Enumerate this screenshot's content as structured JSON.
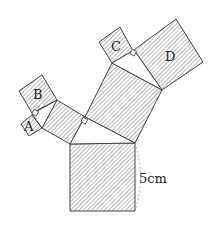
{
  "diagram": {
    "type": "pythagoras-tree",
    "squares": [
      {
        "id": "big-bottom",
        "label": "",
        "points": "70,144 135,143 135,211 70,211"
      },
      {
        "id": "middle-tilted",
        "label": "",
        "points": "85,117 112,63 162,90 135,143"
      },
      {
        "id": "left-medium",
        "label": "",
        "points": "42,128 57,100 85,117 70,144"
      },
      {
        "id": "B",
        "label": "B",
        "points": "19,91 42,75 57,100 32,113"
      },
      {
        "id": "A",
        "label": "A",
        "points": "21,124 32,115 42,128 29,136"
      },
      {
        "id": "C",
        "label": "C",
        "points": "99,42 120,27 133,51 112,63"
      },
      {
        "id": "D",
        "label": "D",
        "points": "134,50 176,19 203,62 162,90"
      }
    ],
    "triangles": [
      {
        "id": "tri-main",
        "points": "70,144 85,117 135,143"
      },
      {
        "id": "tri-left",
        "points": "42,128 32,114 57,100"
      },
      {
        "id": "tri-top",
        "points": "112,63 134,50 162,90"
      }
    ],
    "labels": [
      {
        "text": "A",
        "x": 24,
        "y": 131
      },
      {
        "text": "B",
        "x": 33,
        "y": 99
      },
      {
        "text": "C",
        "x": 111,
        "y": 51
      },
      {
        "text": "D",
        "x": 165,
        "y": 61
      }
    ],
    "dimension": {
      "text": "5cm",
      "x": 139,
      "y": 183
    },
    "hatch_color": "#555555",
    "stroke_color": "#444444"
  }
}
